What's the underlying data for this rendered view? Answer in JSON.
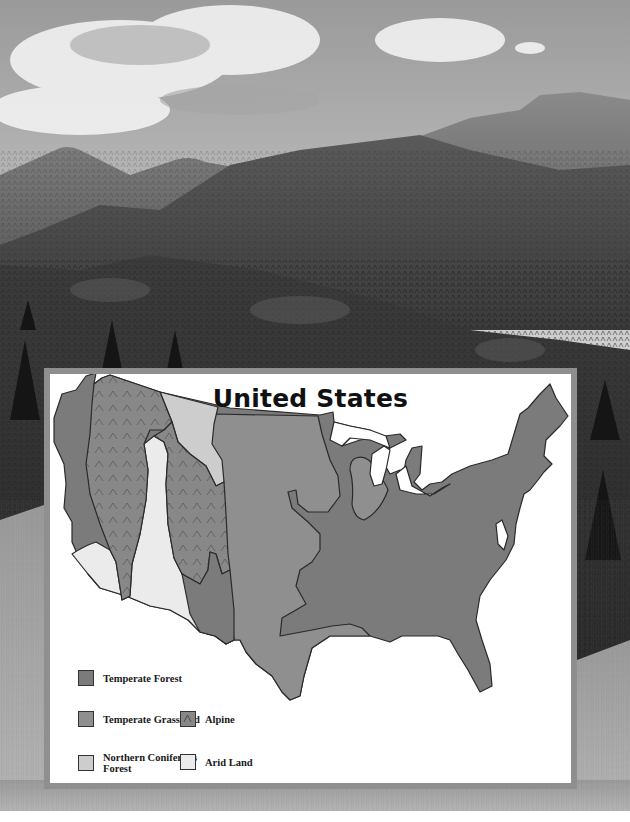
{
  "background_photo": {
    "description": "Black-and-white photograph of forested mountain ridges under a cloudy sky, grassland at bottom",
    "subject": "mountain-forest-landscape"
  },
  "map": {
    "title": "United States",
    "colors": {
      "temperate_forest": "#7b7b7b",
      "temperate_grassland": "#8f8f8f",
      "alpine": "#888888",
      "northern_coniferous_forest": "#cdcdcd",
      "arid_land": "#ebebeb",
      "outline": "#2a2a2a",
      "frame": "#8f8f8f"
    },
    "legend": [
      {
        "id": "temperate-forest",
        "label": "Temperate Forest",
        "color": "#7b7b7b",
        "pattern": "none"
      },
      {
        "id": "temperate-grassland",
        "label": "Temperate Grassland",
        "color": "#8f8f8f",
        "pattern": "none"
      },
      {
        "id": "alpine",
        "label": "Alpine",
        "color": "#888888",
        "pattern": "caret"
      },
      {
        "id": "northern-coniferous-forest",
        "label": "Northern Coniferous Forest",
        "label_line1": "Northern Coniferous",
        "label_line2": "Forest",
        "color": "#cdcdcd",
        "pattern": "none"
      },
      {
        "id": "arid-land",
        "label": "Arid Land",
        "color": "#ebebeb",
        "pattern": "none"
      }
    ]
  }
}
